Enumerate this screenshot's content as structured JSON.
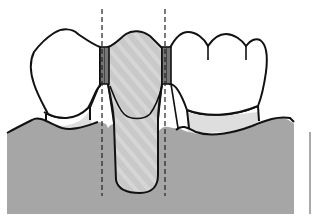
{
  "diagram": {
    "components": [
      {
        "id": "left-abutment-crown",
        "label": "",
        "fill": "#ffffff"
      },
      {
        "id": "left-abutment-root",
        "label": "",
        "fill": "#dcdcdc"
      },
      {
        "id": "pontic",
        "label": "",
        "fill": "#c8c8c8"
      },
      {
        "id": "left-connector",
        "label": "",
        "fill": "#7a7a7a"
      },
      {
        "id": "right-connector",
        "label": "",
        "fill": "#7a7a7a"
      },
      {
        "id": "right-abutment-crown",
        "label": "",
        "fill": "#ffffff"
      },
      {
        "id": "right-abutment-root",
        "label": "",
        "fill": "#dcdcdc"
      },
      {
        "id": "gingiva",
        "label": "",
        "fill": "#a6a6a6"
      },
      {
        "id": "left-path-of-insertion-line",
        "label": "",
        "style": "dashed"
      },
      {
        "id": "right-path-of-insertion-line",
        "label": "",
        "style": "dashed"
      }
    ],
    "colors": {
      "outline": "#111111",
      "gingiva": "#a6a6a6",
      "pontic": "#c9c9c9",
      "pontic_hatch": "#d9d9d9",
      "connector": "#777777",
      "root": "#dedede",
      "crown": "#ffffff",
      "background": "#ffffff"
    }
  }
}
